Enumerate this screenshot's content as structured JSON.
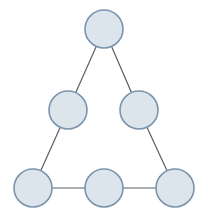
{
  "figure": {
    "background_color": "#ffffff",
    "width": 208,
    "height": 222
  },
  "style": {
    "node_fill": "#dce5ec",
    "node_stroke": "#7a94ad",
    "node_stroke_width": 1.6,
    "node_radius": 19,
    "edge_color": "#555f68",
    "edge_width": 1.2
  },
  "chart_data": {
    "type": "diagram",
    "subtype": "node-link-graph",
    "title": "",
    "xlabel": "",
    "ylabel": "",
    "grid": false,
    "legend": "none",
    "node_count": 6,
    "edge_count": 6,
    "layout": "triangle",
    "rows": [
      1,
      2,
      3
    ],
    "nodes": [
      {
        "id": "n1",
        "label": "",
        "row": 0,
        "col": 0,
        "cx": 104,
        "cy": 29,
        "r": 19
      },
      {
        "id": "n2",
        "label": "",
        "row": 1,
        "col": 0,
        "cx": 68,
        "cy": 110,
        "r": 19
      },
      {
        "id": "n3",
        "label": "",
        "row": 1,
        "col": 1,
        "cx": 139,
        "cy": 110,
        "r": 19
      },
      {
        "id": "n4",
        "label": "",
        "row": 2,
        "col": 0,
        "cx": 33,
        "cy": 188,
        "r": 19
      },
      {
        "id": "n5",
        "label": "",
        "row": 2,
        "col": 1,
        "cx": 104,
        "cy": 188,
        "r": 19
      },
      {
        "id": "n6",
        "label": "",
        "row": 2,
        "col": 2,
        "cx": 175,
        "cy": 188,
        "r": 19
      }
    ],
    "edges": [
      {
        "id": "e1",
        "from": "n1",
        "to": "n2",
        "x1": 104,
        "y1": 29,
        "x2": 68,
        "y2": 110
      },
      {
        "id": "e2",
        "from": "n1",
        "to": "n3",
        "x1": 104,
        "y1": 29,
        "x2": 139,
        "y2": 110
      },
      {
        "id": "e3",
        "from": "n2",
        "to": "n4",
        "x1": 68,
        "y1": 110,
        "x2": 33,
        "y2": 188
      },
      {
        "id": "e4",
        "from": "n3",
        "to": "n6",
        "x1": 139,
        "y1": 110,
        "x2": 175,
        "y2": 188
      },
      {
        "id": "e5",
        "from": "n4",
        "to": "n5",
        "x1": 33,
        "y1": 188,
        "x2": 104,
        "y2": 188
      },
      {
        "id": "e6",
        "from": "n5",
        "to": "n6",
        "x1": 104,
        "y1": 188,
        "x2": 175,
        "y2": 188
      }
    ]
  }
}
